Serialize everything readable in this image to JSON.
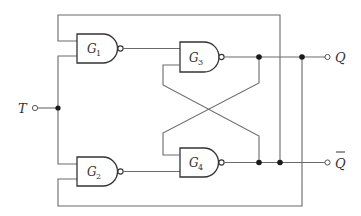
{
  "diagram": {
    "gates": [
      {
        "id": "G1",
        "letter": "G",
        "sub": "1",
        "type": "NAND"
      },
      {
        "id": "G2",
        "letter": "G",
        "sub": "2",
        "type": "NAND"
      },
      {
        "id": "G3",
        "letter": "G",
        "sub": "3",
        "type": "NAND"
      },
      {
        "id": "G4",
        "letter": "G",
        "sub": "4",
        "type": "NAND"
      }
    ],
    "input": {
      "label": "T"
    },
    "outputs": [
      {
        "label": "Q",
        "overbar": false
      },
      {
        "label": "Q",
        "overbar": true
      }
    ],
    "colors": {
      "wire": "#6a6a6a",
      "gate": "#333333",
      "junction": "#1a1a1a",
      "background": "#ffffff"
    }
  }
}
